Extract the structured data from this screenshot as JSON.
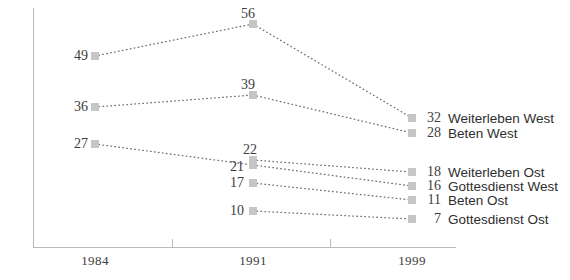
{
  "chart_data": {
    "type": "line",
    "title": "",
    "subtitle": "",
    "xlabel": "",
    "ylabel": "",
    "categories": [
      "1984",
      "1991",
      "1999"
    ],
    "x": [
      1984,
      1991,
      1999
    ],
    "grid": false,
    "legend_position": "right-inline",
    "marker": "square",
    "line_style": "dotted",
    "ylim": [
      0,
      60
    ],
    "series": [
      {
        "name": "Weiterleben West",
        "values": [
          49,
          56,
          32
        ],
        "labels": [
          "49",
          "56",
          "32"
        ],
        "end_value": "32",
        "end_label": "Weiterleben West"
      },
      {
        "name": "Beten West",
        "values": [
          36,
          39,
          28
        ],
        "labels": [
          "36",
          "39",
          "28"
        ],
        "end_value": "28",
        "end_label": "Beten West"
      },
      {
        "name": "Weiterleben Ost",
        "values": [
          null,
          22,
          18
        ],
        "labels": [
          "",
          "22",
          "18"
        ],
        "end_value": "18",
        "end_label": "Weiterleben Ost"
      },
      {
        "name": "Gottesdienst West",
        "values": [
          27,
          21,
          16
        ],
        "labels": [
          "27",
          "21",
          "16"
        ],
        "end_value": "16",
        "end_label": "Gottesdienst West"
      },
      {
        "name": "Beten Ost",
        "values": [
          null,
          17,
          11
        ],
        "labels": [
          "",
          "17",
          "11"
        ],
        "end_value": "11",
        "end_label": "Beten Ost"
      },
      {
        "name": "Gottesdienst Ost",
        "values": [
          null,
          10,
          7
        ],
        "labels": [
          "",
          "10",
          "7"
        ],
        "end_value": "7",
        "end_label": "Gottesdienst Ost"
      }
    ],
    "colors": {
      "marker": "#c6c6c6",
      "line": "#6e6e6e",
      "axis": "#b9b9b9",
      "value_text": "#3d3d3d",
      "legend_text": "#2e2e2e",
      "background": "#ffffff"
    }
  },
  "axis": {
    "x_ticks": [
      {
        "label": "1984",
        "x": 95
      },
      {
        "label": "1991",
        "x": 253
      },
      {
        "label": "1999",
        "x": 412
      }
    ],
    "tick_marks": [
      172,
      330
    ]
  },
  "points": [
    {
      "name": "weiterleben-west-1984",
      "x": 95,
      "y": 56,
      "label": "49",
      "placement": "left-of",
      "lx": 88,
      "ly": 56
    },
    {
      "name": "weiterleben-west-1991",
      "x": 253,
      "y": 24,
      "label": "56",
      "placement": "above",
      "lx": 248,
      "ly": 22
    },
    {
      "name": "weiterleben-west-1999",
      "x": 412,
      "y": 118,
      "label": "32",
      "placement": "legend",
      "lx": 0,
      "ly": 0
    },
    {
      "name": "beten-west-1984",
      "x": 95,
      "y": 107,
      "label": "36",
      "placement": "left-of",
      "lx": 88,
      "ly": 107
    },
    {
      "name": "beten-west-1991",
      "x": 253,
      "y": 95,
      "label": "39",
      "placement": "above",
      "lx": 248,
      "ly": 93
    },
    {
      "name": "beten-west-1999",
      "x": 412,
      "y": 133,
      "label": "28",
      "placement": "legend",
      "lx": 0,
      "ly": 0
    },
    {
      "name": "weiterleben-ost-1991",
      "x": 253,
      "y": 160,
      "label": "22",
      "placement": "above",
      "lx": 250,
      "ly": 158
    },
    {
      "name": "weiterleben-ost-1999",
      "x": 412,
      "y": 172,
      "label": "18",
      "placement": "legend",
      "lx": 0,
      "ly": 0
    },
    {
      "name": "gottesdienst-west-1984",
      "x": 95,
      "y": 144,
      "label": "27",
      "placement": "left-of",
      "lx": 88,
      "ly": 144
    },
    {
      "name": "gottesdienst-west-1991",
      "x": 253,
      "y": 165,
      "label": "21",
      "placement": "left-of",
      "lx": 244,
      "ly": 167
    },
    {
      "name": "gottesdienst-west-1999",
      "x": 412,
      "y": 186,
      "label": "16",
      "placement": "legend",
      "lx": 0,
      "ly": 0
    },
    {
      "name": "beten-ost-1991",
      "x": 253,
      "y": 183,
      "label": "17",
      "placement": "left-of",
      "lx": 244,
      "ly": 183
    },
    {
      "name": "beten-ost-1999",
      "x": 412,
      "y": 200,
      "label": "11",
      "placement": "legend",
      "lx": 0,
      "ly": 0
    },
    {
      "name": "gottesdienst-ost-1991",
      "x": 253,
      "y": 211,
      "label": "10",
      "placement": "left-of",
      "lx": 244,
      "ly": 211
    },
    {
      "name": "gottesdienst-ost-1999",
      "x": 412,
      "y": 219,
      "label": "7",
      "placement": "legend",
      "lx": 0,
      "ly": 0
    }
  ],
  "segments": [
    {
      "name": "seg-weiterleben-west-a",
      "x1": 95,
      "y1": 56,
      "x2": 253,
      "y2": 24
    },
    {
      "name": "seg-weiterleben-west-b",
      "x1": 253,
      "y1": 24,
      "x2": 412,
      "y2": 118
    },
    {
      "name": "seg-beten-west-a",
      "x1": 95,
      "y1": 107,
      "x2": 253,
      "y2": 95
    },
    {
      "name": "seg-beten-west-b",
      "x1": 253,
      "y1": 95,
      "x2": 412,
      "y2": 133
    },
    {
      "name": "seg-weiterleben-ost-b",
      "x1": 253,
      "y1": 160,
      "x2": 412,
      "y2": 172
    },
    {
      "name": "seg-gottesdienst-west-a",
      "x1": 95,
      "y1": 144,
      "x2": 253,
      "y2": 165
    },
    {
      "name": "seg-gottesdienst-west-b",
      "x1": 253,
      "y1": 165,
      "x2": 412,
      "y2": 186
    },
    {
      "name": "seg-beten-ost-b",
      "x1": 253,
      "y1": 183,
      "x2": 412,
      "y2": 200
    },
    {
      "name": "seg-gottesdienst-ost-b",
      "x1": 253,
      "y1": 211,
      "x2": 412,
      "y2": 219
    }
  ],
  "legend_rows": [
    {
      "name": "weiterleben-west",
      "value": "32",
      "label": "Weiterleben West",
      "y": 118
    },
    {
      "name": "beten-west",
      "value": "28",
      "label": "Beten West",
      "y": 133
    },
    {
      "name": "weiterleben-ost",
      "value": "18",
      "label": "Weiterleben Ost",
      "y": 172
    },
    {
      "name": "gottesdienst-west",
      "value": "16",
      "label": "Gottesdienst West",
      "y": 186
    },
    {
      "name": "beten-ost",
      "value": "11",
      "label": "Beten Ost",
      "y": 200
    },
    {
      "name": "gottesdienst-ost",
      "value": "7",
      "label": "Gottesdienst Ost",
      "y": 219
    }
  ]
}
